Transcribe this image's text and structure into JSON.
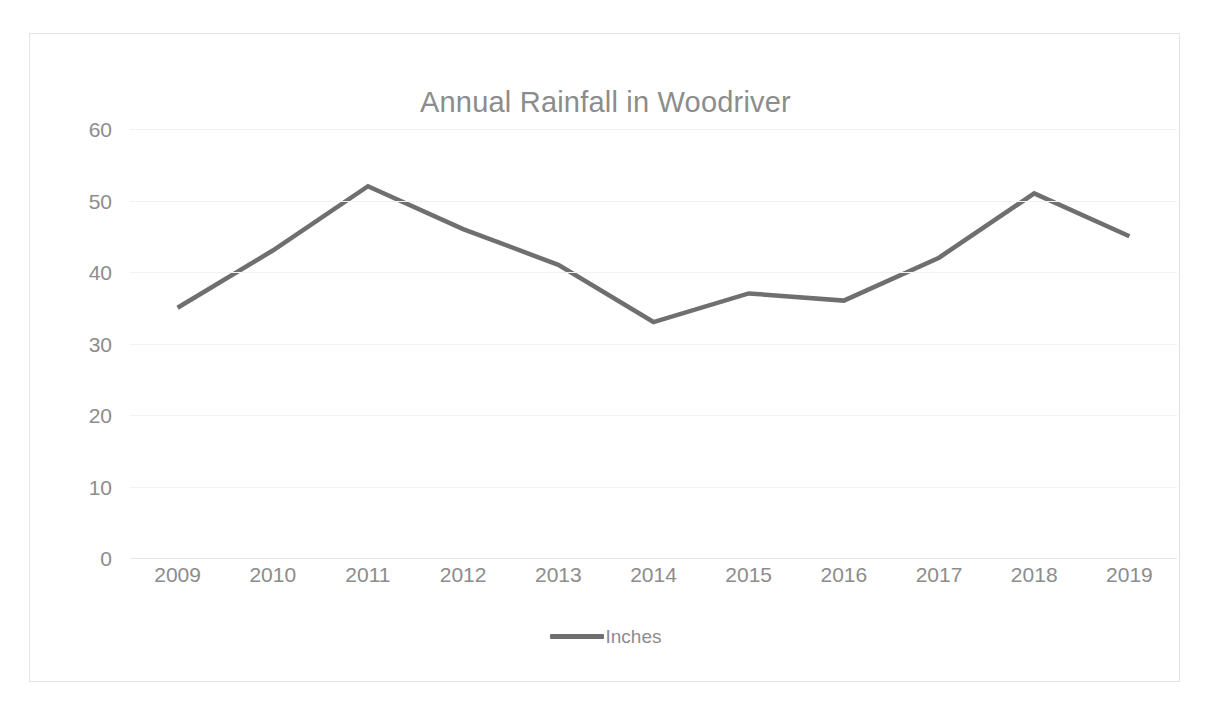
{
  "scan": {
    "top_artifact_text": " "
  },
  "chart_data": {
    "type": "line",
    "title": "Annual Rainfall in Woodriver",
    "xlabel": "",
    "ylabel": "",
    "categories": [
      "2009",
      "2010",
      "2011",
      "2012",
      "2013",
      "2014",
      "2015",
      "2016",
      "2017",
      "2018",
      "2019"
    ],
    "series": [
      {
        "name": "Inches",
        "color": "#6f6f6f",
        "values": [
          35,
          43,
          52,
          46,
          41,
          33,
          37,
          36,
          42,
          51,
          45
        ]
      }
    ],
    "ylim": [
      0,
      60
    ],
    "y_ticks": [
      0,
      10,
      20,
      30,
      40,
      50,
      60
    ],
    "y_tick_labels": [
      "0",
      "10",
      "20",
      "30",
      "40",
      "50",
      "60"
    ],
    "grid": true,
    "legend_position": "bottom",
    "legend_entries": [
      "Inches"
    ]
  },
  "style": {
    "text_color": "#8c8c8c",
    "gridline_color": "#f2f2f3",
    "frame_color": "#e3e3e5",
    "line_color": "#6f6f6f"
  }
}
